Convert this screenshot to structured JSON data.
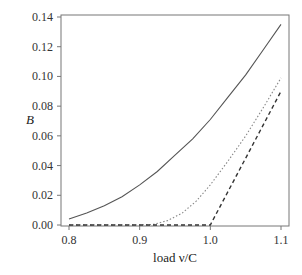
{
  "chart_data": {
    "type": "line",
    "title": "",
    "xlabel": "load ν/C",
    "ylabel": "B",
    "xlim": [
      0.8,
      1.1
    ],
    "ylim": [
      0.0,
      0.14
    ],
    "grid": false,
    "legend": null,
    "x_ticks": [
      0.8,
      0.9,
      1.0,
      1.1
    ],
    "x_tick_labels": [
      "0.8",
      "0.9",
      "1.0",
      "1.1"
    ],
    "y_ticks": [
      0.0,
      0.02,
      0.04,
      0.06,
      0.08,
      0.1,
      0.12,
      0.14
    ],
    "y_tick_labels": [
      "0.00",
      "0.02",
      "0.04",
      "0.06",
      "0.08",
      "0.10",
      "0.12",
      "0.14"
    ],
    "series": [
      {
        "name": "solid",
        "style": "solid",
        "color": "#555555",
        "x": [
          0.8,
          0.825,
          0.85,
          0.875,
          0.9,
          0.925,
          0.95,
          0.975,
          1.0,
          1.025,
          1.05,
          1.075,
          1.1
        ],
        "values": [
          0.004,
          0.008,
          0.013,
          0.019,
          0.027,
          0.036,
          0.047,
          0.058,
          0.071,
          0.086,
          0.101,
          0.118,
          0.135
        ]
      },
      {
        "name": "dotted",
        "style": "dotted",
        "color": "#888888",
        "x": [
          0.8,
          0.85,
          0.9,
          0.92,
          0.94,
          0.96,
          0.98,
          1.0,
          1.025,
          1.05,
          1.075,
          1.1
        ],
        "values": [
          0.0,
          0.0,
          0.0,
          0.0005,
          0.003,
          0.008,
          0.016,
          0.027,
          0.043,
          0.06,
          0.079,
          0.099
        ]
      },
      {
        "name": "dashed",
        "style": "dashed",
        "color": "#333333",
        "x": [
          0.8,
          0.9,
          1.0,
          1.05,
          1.1
        ],
        "values": [
          0.0,
          0.0,
          0.0,
          0.045,
          0.09
        ]
      }
    ]
  },
  "labels": {
    "xlabel": "load ν/C",
    "ylabel": "B"
  }
}
